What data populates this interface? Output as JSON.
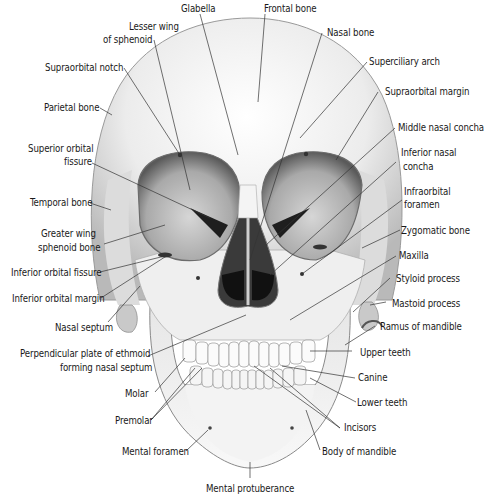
{
  "diagram": {
    "colors": {
      "bone": "#f2f2f2",
      "shadow": "#9a9a9a",
      "cavity": "#1e1e1e",
      "leader": "#333333",
      "text": "#1a1a1a"
    },
    "labels": {
      "glabella": "Glabella",
      "frontal_bone": "Frontal bone",
      "lesser_wing_1": "Lesser wing",
      "lesser_wing_2": "of sphenoid",
      "nasal_bone": "Nasal bone",
      "superciliary_arch": "Superciliary arch",
      "supraorbital_notch": "Supraorbital notch",
      "supraorbital_margin": "Supraorbital margin",
      "parietal_bone": "Parietal bone",
      "middle_nasal_concha": "Middle nasal concha",
      "superior_orbital_fissure_1": "Superior orbital",
      "superior_orbital_fissure_2": "fissure",
      "inferior_nasal_concha_1": "Inferior nasal",
      "inferior_nasal_concha_2": "concha",
      "infraorbital_foramen_1": "Infraorbital",
      "infraorbital_foramen_2": "foramen",
      "temporal_bone": "Temporal bone",
      "zygomatic_bone": "Zygomatic bone",
      "greater_wing_1": "Greater wing",
      "greater_wing_2": "sphenoid bone",
      "maxilla": "Maxilla",
      "inferior_orbital_fissure": "Inferior orbital fissure",
      "styloid_process": "Styloid process",
      "inferior_orbital_margin": "Inferior orbital margin",
      "mastoid_process": "Mastoid process",
      "nasal_septum": "Nasal septum",
      "ramus_of_mandible": "Ramus of mandible",
      "perpendicular_plate_1": "Perpendicular plate of ethmoid",
      "perpendicular_plate_2": "forming nasal septum",
      "upper_teeth": "Upper teeth",
      "canine": "Canine",
      "molar": "Molar",
      "lower_teeth": "Lower teeth",
      "premolar": "Premolar",
      "incisors": "Incisors",
      "mental_foramen": "Mental foramen",
      "body_of_mandible": "Body of mandible",
      "mental_protuberance": "Mental protuberance"
    }
  }
}
